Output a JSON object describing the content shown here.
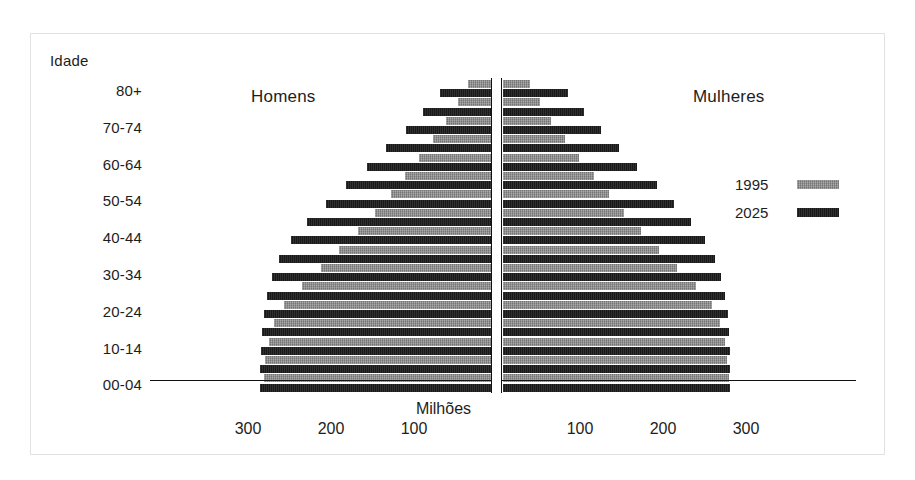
{
  "axis": {
    "age_axis_title": "Idade",
    "age_ticks": [
      "80+",
      "70-74",
      "60-64",
      "50-54",
      "40-44",
      "30-34",
      "20-24",
      "10-14",
      "00-04"
    ],
    "x_axis_title": "Milhões",
    "x_ticks_left": [
      "300",
      "200",
      "100"
    ],
    "x_ticks_right": [
      "100",
      "200",
      "300"
    ]
  },
  "headings": {
    "men": "Homens",
    "women": "Mulheres"
  },
  "legend": {
    "items": [
      {
        "label": "1995",
        "color": "#8c8c8c"
      },
      {
        "label": "2025",
        "color": "#191919"
      }
    ]
  },
  "colors": {
    "series_1995": "#8c8c8c",
    "series_2025": "#191919",
    "axis_line": "#111111",
    "frame": "#e2e2e2",
    "text": "#1d1d1d"
  },
  "chart_data": {
    "type": "bar",
    "subtype": "population-pyramid",
    "title": "",
    "xlabel": "Milhões",
    "ylabel": "Idade",
    "xlim": [
      -360,
      360
    ],
    "grid": false,
    "legend_position": "right",
    "categories": [
      "80+",
      "75-79",
      "70-74",
      "65-69",
      "60-64",
      "55-59",
      "50-54",
      "45-49",
      "40-44",
      "35-39",
      "30-34",
      "25-29",
      "20-24",
      "15-19",
      "10-14",
      "05-09",
      "00-04"
    ],
    "series": [
      {
        "name": "1995",
        "color": "#8c8c8c",
        "men": [
          28,
          40,
          54,
          70,
          87,
          104,
          121,
          140,
          160,
          183,
          205,
          228,
          250,
          262,
          268,
          272,
          274
        ],
        "women": [
          32,
          44,
          58,
          75,
          92,
          110,
          128,
          146,
          166,
          188,
          210,
          232,
          252,
          262,
          267,
          270,
          272
        ]
      },
      {
        "name": "2025",
        "color": "#191919",
        "men": [
          62,
          82,
          103,
          126,
          150,
          175,
          199,
          222,
          241,
          255,
          264,
          270,
          274,
          276,
          277,
          278,
          278
        ],
        "women": [
          78,
          98,
          118,
          140,
          162,
          185,
          206,
          226,
          243,
          255,
          263,
          268,
          271,
          272,
          273,
          273,
          273
        ]
      }
    ],
    "units": "millions"
  },
  "geometry": {
    "center_x": 497,
    "px_per_100": 83,
    "first_band_top": 80,
    "band_pitch": 18.4,
    "bar_height": 8
  }
}
